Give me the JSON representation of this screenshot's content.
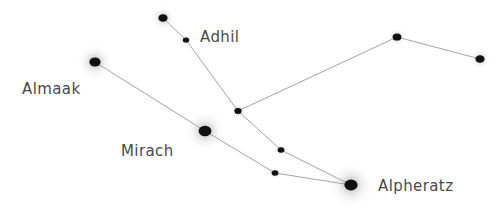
{
  "chart_data": {
    "type": "scatter",
    "xlabel": "",
    "ylabel": "",
    "xlim": [
      0,
      504
    ],
    "ylim": [
      0,
      215
    ],
    "grid": false,
    "legend": "none",
    "background_color": "#ffffff",
    "star_color": "#111111",
    "glow_color": "#9a9a9a",
    "line_color": "#888888",
    "label_color": "#4a4a4a",
    "stars": [
      {
        "id": "adhil-top",
        "x": 163,
        "y": 18,
        "radius": 4.6,
        "glow": 13,
        "label": ""
      },
      {
        "id": "adhil",
        "x": 186,
        "y": 40,
        "radius": 3.2,
        "glow": 7,
        "label": "Adhil"
      },
      {
        "id": "almaak",
        "x": 95,
        "y": 62,
        "radius": 5.6,
        "glow": 19,
        "label": "Almaak"
      },
      {
        "id": "junction",
        "x": 238,
        "y": 111,
        "radius": 3.6,
        "glow": 8,
        "label": ""
      },
      {
        "id": "mirach",
        "x": 205,
        "y": 131,
        "radius": 6.4,
        "glow": 22,
        "label": "Mirach"
      },
      {
        "id": "delta-and",
        "x": 281,
        "y": 150,
        "radius": 3.4,
        "glow": 7,
        "label": ""
      },
      {
        "id": "pi-and",
        "x": 275,
        "y": 173,
        "radius": 3.4,
        "glow": 7,
        "label": ""
      },
      {
        "id": "alpheratz",
        "x": 351,
        "y": 185,
        "radius": 6.6,
        "glow": 24,
        "label": "Alpheratz"
      },
      {
        "id": "upsilon-and",
        "x": 397,
        "y": 37,
        "radius": 4.4,
        "glow": 10,
        "label": ""
      },
      {
        "id": "51-and",
        "x": 480,
        "y": 59,
        "radius": 4.6,
        "glow": 11,
        "label": ""
      }
    ],
    "lines": [
      {
        "from": "adhil-top",
        "to": "adhil"
      },
      {
        "from": "adhil",
        "to": "junction"
      },
      {
        "from": "junction",
        "to": "upsilon-and"
      },
      {
        "from": "upsilon-and",
        "to": "51-and"
      },
      {
        "from": "junction",
        "to": "delta-and"
      },
      {
        "from": "delta-and",
        "to": "alpheratz"
      },
      {
        "from": "almaak",
        "to": "mirach"
      },
      {
        "from": "mirach",
        "to": "pi-and"
      },
      {
        "from": "pi-and",
        "to": "alpheratz"
      }
    ],
    "labels": [
      {
        "id": "label-adhil",
        "text": "Adhil",
        "x": 200,
        "y": 30,
        "font_size": 15
      },
      {
        "id": "label-almaak",
        "text": "Almaak",
        "x": 22,
        "y": 82,
        "font_size": 15
      },
      {
        "id": "label-mirach",
        "text": "Mirach",
        "x": 121,
        "y": 144,
        "font_size": 15
      },
      {
        "id": "label-alpheratz",
        "text": "Alpheratz",
        "x": 378,
        "y": 179,
        "font_size": 15
      }
    ]
  }
}
